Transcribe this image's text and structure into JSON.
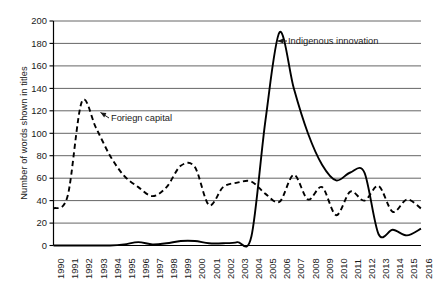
{
  "chart_data": {
    "type": "line",
    "title": "",
    "xlabel": "",
    "ylabel": "Number of words shown in titles",
    "ylim": [
      0,
      200
    ],
    "ytick_step": 20,
    "yticks": [
      0,
      20,
      40,
      60,
      80,
      100,
      120,
      140,
      160,
      180,
      200
    ],
    "grid": "horizontal",
    "legend": "none (series labeled by in-plot annotations with leader arrows)",
    "categories": [
      "1990",
      "1991",
      "1992",
      "1993",
      "1994",
      "1995",
      "1996",
      "1997",
      "1998",
      "1999",
      "2000",
      "2001",
      "2002",
      "2003",
      "2004",
      "2005",
      "2006",
      "2007",
      "2008",
      "2009",
      "2010",
      "2011",
      "2012",
      "2013",
      "2014",
      "2015",
      "2016"
    ],
    "series": [
      {
        "name": "Foriegn capital",
        "style": "dashed",
        "color": "#000000",
        "values": [
          33,
          44,
          128,
          105,
          80,
          62,
          52,
          44,
          52,
          71,
          70,
          36,
          52,
          56,
          57,
          46,
          39,
          63,
          41,
          52,
          27,
          48,
          40,
          53,
          30,
          41,
          33
        ]
      },
      {
        "name": "Indigenous innovation",
        "style": "solid",
        "color": "#000000",
        "values": [
          0,
          0,
          0,
          0,
          0,
          1,
          3,
          1,
          2,
          4,
          4,
          2,
          2,
          3,
          8,
          112,
          190,
          140,
          100,
          72,
          58,
          65,
          65,
          10,
          14,
          9,
          15
        ]
      }
    ],
    "annotations": [
      {
        "text": "Foriegn capital",
        "series": "Foriegn capital",
        "arrow": true
      },
      {
        "text": "Indigenous innovation",
        "series": "Indigenous innovation",
        "arrow": true
      }
    ]
  },
  "axis": {
    "y_title": "Number of words shown in titles",
    "y_labels": [
      "200",
      "180",
      "160",
      "140",
      "120",
      "100",
      "80",
      "60",
      "40",
      "20",
      "0"
    ],
    "x_labels": [
      "1990",
      "1991",
      "1992",
      "1993",
      "1994",
      "1995",
      "1996",
      "1997",
      "1998",
      "1999",
      "2000",
      "2001",
      "2002",
      "2003",
      "2004",
      "2005",
      "2006",
      "2007",
      "2008",
      "2009",
      "2010",
      "2011",
      "2012",
      "2013",
      "2014",
      "2015",
      "2016"
    ]
  },
  "annotations": {
    "foreign_capital": "Foriegn capital",
    "indigenous_innovation": "Indigenous innovation"
  },
  "colors": {
    "line": "#000000",
    "grid": "#555555",
    "axis": "#000000",
    "background": "#ffffff"
  }
}
